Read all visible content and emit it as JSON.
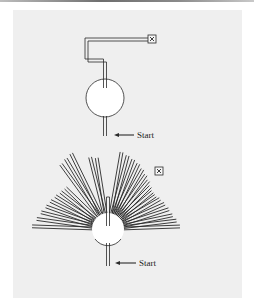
{
  "figure": {
    "background": "#efefef",
    "line_color": "#2a2a2a",
    "panels": [
      {
        "id": "top",
        "description": "Path from start through circular chamber, then up and around to target box",
        "start_label": "Start",
        "target_icon": "boxed-x-icon"
      },
      {
        "id": "bottom",
        "description": "Many radial paths fanning out from circular chamber, with separate target box",
        "start_label": "Start",
        "target_icon": "boxed-x-icon",
        "ray_count_approx": 36
      }
    ]
  }
}
